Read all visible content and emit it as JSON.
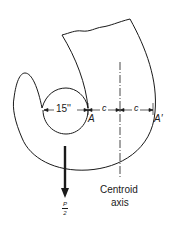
{
  "figure": {
    "type": "engineering diagram"
  },
  "labels": {
    "diameter": "15''",
    "dim_c_left": "c",
    "dim_c_right": "c",
    "point_a": "A",
    "point_a_prime": "A′",
    "centroid_line1": "Centroid",
    "centroid_line2": "axis",
    "load_numerator": "P",
    "load_denominator": "2"
  },
  "colors": {
    "stroke": "#1a1a1a",
    "background": "#ffffff"
  }
}
